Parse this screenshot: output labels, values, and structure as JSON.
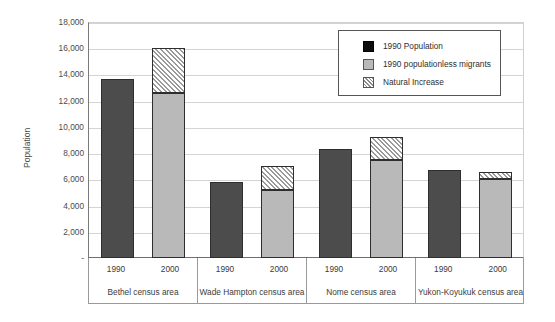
{
  "chart_data": {
    "type": "bar",
    "title": "",
    "xlabel": "",
    "ylabel": "Population",
    "ylim": [
      0,
      18000
    ],
    "ytick_labels": [
      "18,000",
      "16,000",
      "14,000",
      "12,000",
      "10,000",
      "8,000",
      "6,000",
      "4,000",
      "2,000",
      "-"
    ],
    "ytick_values": [
      18000,
      16000,
      14000,
      12000,
      10000,
      8000,
      6000,
      4000,
      2000,
      0
    ],
    "grid": true,
    "stacked": true,
    "legend_position": "top-right",
    "legend": [
      "1990 Population",
      "1990 populationless migrants",
      "Natural Increase"
    ],
    "categories": [
      "Bethel census area",
      "Wade Hampton census area",
      "Nome census area",
      "Yukon-Koyukuk census area"
    ],
    "sub_categories": [
      "1990",
      "2000"
    ],
    "series": [
      {
        "name": "1990 Population",
        "values": [
          13650,
          5800,
          8300,
          6750
        ]
      },
      {
        "name": "1990 populationless migrants",
        "values": [
          12550,
          5150,
          7500,
          6000
        ]
      },
      {
        "name": "Natural Increase",
        "values": [
          3500,
          1850,
          1700,
          550
        ]
      }
    ],
    "totals_2000": [
      16050,
      7000,
      9200,
      6550
    ],
    "colors": {
      "population_1990": "#4c4c4c",
      "migrants": "#b9b9b9",
      "natural_increase": "#ffffff",
      "outline": "#2e2e2e",
      "gridline": "#d4d4d4"
    }
  },
  "axis": {
    "y_title": "Population"
  }
}
